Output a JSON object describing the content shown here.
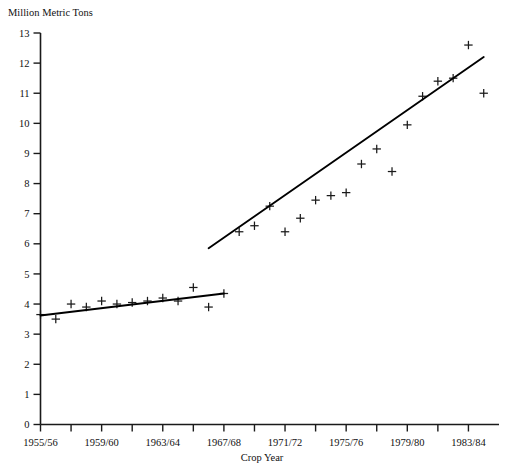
{
  "chart_data": {
    "type": "scatter",
    "title": "",
    "ylabel": "Million Metric Tons",
    "xlabel": "Crop Year",
    "ylim": [
      0,
      13
    ],
    "ytick_step": 1,
    "yticks": [
      0,
      1,
      2,
      3,
      4,
      5,
      6,
      7,
      8,
      9,
      10,
      11,
      12,
      13
    ],
    "xlim": [
      1955,
      1985
    ],
    "xtick_labels": [
      "1955/56",
      "1959/60",
      "1963/64",
      "1967/68",
      "1971/72",
      "1975/76",
      "1979/80",
      "1983/84"
    ],
    "xtick_years": [
      1955,
      1959,
      1963,
      1967,
      1971,
      1975,
      1979,
      1983
    ],
    "minor_xtick_years": [
      1957,
      1961,
      1965,
      1969,
      1973,
      1977,
      1981
    ],
    "grid": false,
    "legend": "none",
    "marker_style": "plus",
    "x": [
      1955,
      1956,
      1957,
      1958,
      1959,
      1960,
      1961,
      1962,
      1963,
      1964,
      1965,
      1966,
      1967,
      1968,
      1969,
      1970,
      1971,
      1972,
      1973,
      1974,
      1975,
      1976,
      1977,
      1978,
      1979,
      1980,
      1981,
      1982,
      1983,
      1984
    ],
    "values": [
      3.65,
      3.5,
      4.0,
      3.9,
      4.1,
      4.0,
      4.05,
      4.1,
      4.2,
      4.1,
      4.55,
      3.9,
      4.35,
      6.4,
      6.6,
      7.25,
      6.4,
      6.85,
      7.45,
      7.6,
      7.7,
      8.65,
      9.15,
      8.4,
      9.95,
      10.9,
      11.4,
      11.5,
      12.6,
      11.0
    ],
    "series": [
      {
        "name": "Production",
        "values": [
          3.65,
          3.5,
          4.0,
          3.9,
          4.1,
          4.0,
          4.05,
          4.1,
          4.2,
          4.1,
          4.55,
          3.9,
          4.35,
          6.4,
          6.6,
          7.25,
          6.4,
          6.85,
          7.45,
          7.6,
          7.7,
          8.65,
          9.15,
          8.4,
          9.95,
          10.9,
          11.4,
          11.5,
          12.6,
          11.0
        ]
      }
    ],
    "trend_lines": [
      {
        "name": "trend-segment-early",
        "x_start": 1955,
        "y_start": 3.62,
        "x_end": 1967,
        "y_end": 4.35
      },
      {
        "name": "trend-segment-late",
        "x_start": 1966,
        "y_start": 5.85,
        "x_end": 1984,
        "y_end": 12.2
      }
    ]
  }
}
